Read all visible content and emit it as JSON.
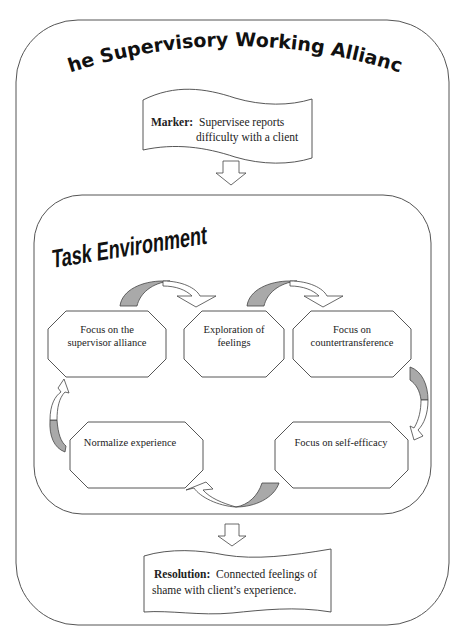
{
  "title": "The Supervisory Working Alliance",
  "marker": {
    "label": "Marker:",
    "line1": "Supervisee reports",
    "line2": "difficulty with a client"
  },
  "task_environment": {
    "title": "Task Environment",
    "nodes": [
      {
        "id": "focus-alliance",
        "line1": "Focus on the",
        "line2": "supervisor alliance"
      },
      {
        "id": "exploration-feelings",
        "line1": "Exploration of",
        "line2": "feelings"
      },
      {
        "id": "focus-countertransference",
        "line1": "Focus on",
        "line2": "countertransference"
      },
      {
        "id": "focus-self-efficacy",
        "line1": "Focus on self-efficacy",
        "line2": ""
      },
      {
        "id": "normalize-experience",
        "line1": "Normalize experience",
        "line2": ""
      }
    ],
    "cycle_order": [
      "Focus on the supervisor alliance",
      "Exploration of feelings",
      "Focus on countertransference",
      "Focus on self-efficacy",
      "Normalize experience"
    ]
  },
  "resolution": {
    "label": "Resolution:",
    "line1": "Connected feelings of",
    "line2": "shame with client’s experience."
  },
  "colors": {
    "arrow_shade": "#a9a9a9",
    "stroke": "#444444",
    "background": "#ffffff"
  }
}
